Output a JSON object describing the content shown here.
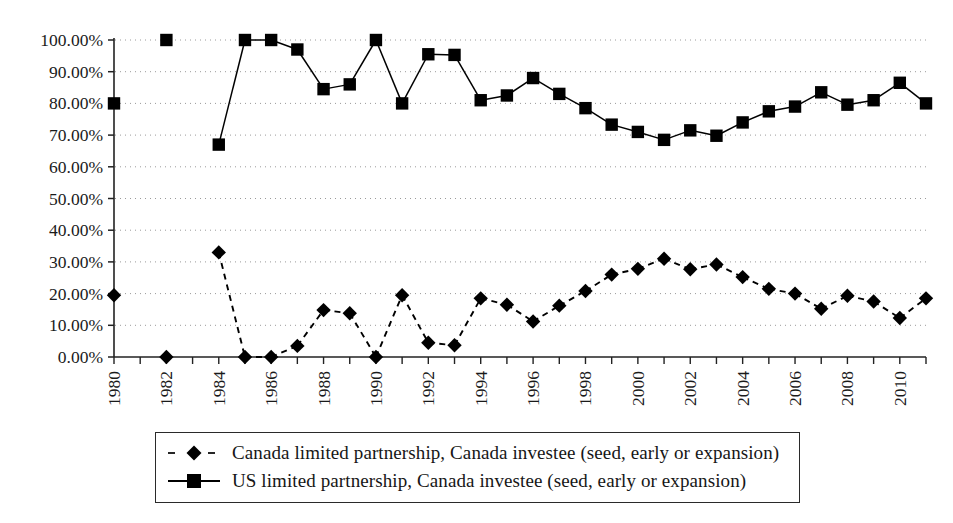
{
  "chart_data": {
    "type": "line",
    "title": "",
    "xlabel": "",
    "ylabel": "",
    "ylim": [
      0,
      100
    ],
    "ytick_labels": [
      "0.00%",
      "10.00%",
      "20.00%",
      "30.00%",
      "40.00%",
      "50.00%",
      "60.00%",
      "70.00%",
      "80.00%",
      "90.00%",
      "100.00%"
    ],
    "ytick_values": [
      0,
      10,
      20,
      30,
      40,
      50,
      60,
      70,
      80,
      90,
      100
    ],
    "xtick_labels": [
      "1980",
      "1982",
      "1984",
      "1986",
      "1988",
      "1990",
      "1992",
      "1994",
      "1996",
      "1998",
      "2000",
      "2002",
      "2004",
      "2006",
      "2008",
      "2010"
    ],
    "x": [
      1980,
      1981,
      1982,
      1983,
      1984,
      1985,
      1986,
      1987,
      1988,
      1989,
      1990,
      1991,
      1992,
      1993,
      1994,
      1995,
      1996,
      1997,
      1998,
      1999,
      2000,
      2001,
      2002,
      2003,
      2004,
      2005,
      2006,
      2007,
      2008,
      2009,
      2010,
      2011
    ],
    "grid": true,
    "grid_style": "dotted-horizontal",
    "legend_position": "bottom",
    "series": [
      {
        "name": "Canada limited partnership, Canada investee (seed, early or expansion)",
        "marker": "diamond",
        "line_style": "dashed",
        "color": "#000000",
        "values": [
          19.5,
          null,
          0.0,
          null,
          33.0,
          0.0,
          0.0,
          3.5,
          14.8,
          13.8,
          0.0,
          19.5,
          4.5,
          3.7,
          18.5,
          16.5,
          11.2,
          16.2,
          20.8,
          26.0,
          27.8,
          31.0,
          27.7,
          29.2,
          25.2,
          21.5,
          20.0,
          15.2,
          19.3,
          17.5,
          12.3,
          18.5
        ]
      },
      {
        "name": "US limited partnership, Canada investee (seed, early or expansion)",
        "marker": "square",
        "line_style": "solid",
        "color": "#000000",
        "values": [
          80.0,
          null,
          100.0,
          null,
          67.0,
          100.0,
          100.0,
          97.0,
          84.5,
          86.0,
          100.0,
          80.0,
          95.5,
          95.3,
          81.0,
          82.5,
          88.0,
          83.0,
          78.5,
          73.3,
          71.0,
          68.5,
          71.5,
          69.8,
          74.0,
          77.5,
          79.0,
          83.5,
          79.6,
          81.0,
          86.5,
          80.0
        ]
      }
    ]
  },
  "legend": {
    "entries": [
      {
        "label": "Canada limited partnership, Canada investee (seed, early or expansion)",
        "marker": "diamond",
        "style": "dashed"
      },
      {
        "label": "US limited partnership, Canada investee (seed, early or expansion)",
        "marker": "square",
        "style": "solid"
      }
    ]
  }
}
